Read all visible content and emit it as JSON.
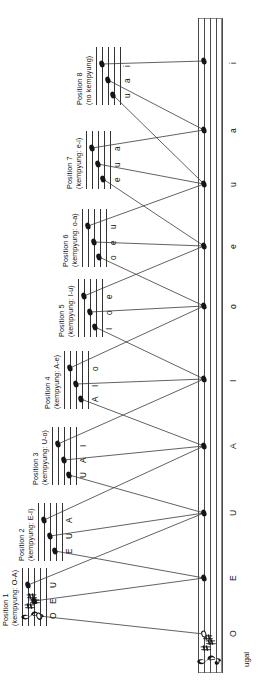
{
  "figure": {
    "title_present": false,
    "orientation": "rotated-90-ccw",
    "main_staff": {
      "name": "ugal",
      "label": "ugal",
      "clef": "treble-clef",
      "key_signature": "three-sharps",
      "notes": [
        {
          "label": "O",
          "head": "open"
        },
        {
          "label": "E",
          "head": "filled"
        },
        {
          "label": "U",
          "head": "filled"
        },
        {
          "label": "A",
          "head": "filled"
        },
        {
          "label": "I",
          "head": "filled"
        },
        {
          "label": "o",
          "head": "filled"
        },
        {
          "label": "e",
          "head": "filled"
        },
        {
          "label": "u",
          "head": "filled"
        },
        {
          "label": "a",
          "head": "filled"
        },
        {
          "label": "i",
          "head": "filled"
        }
      ]
    },
    "positions": [
      {
        "id": 1,
        "title": "Position 1",
        "subtitle": "(kempyung: O-A)",
        "clef": "treble-clef",
        "key_signature": "three-sharps",
        "notes": [
          {
            "label": "O",
            "head": "open"
          },
          {
            "label": "E",
            "head": "filled"
          },
          {
            "label": "U",
            "head": "filled"
          }
        ]
      },
      {
        "id": 2,
        "title": "Position 2",
        "subtitle": "(kempyung: E-I)",
        "clef": "none",
        "key_signature": "none",
        "notes": [
          {
            "label": "E",
            "head": "filled"
          },
          {
            "label": "U",
            "head": "filled"
          },
          {
            "label": "A",
            "head": "filled"
          }
        ]
      },
      {
        "id": 3,
        "title": "Position 3",
        "subtitle": "(kempyung: U-o)",
        "clef": "none",
        "key_signature": "none",
        "notes": [
          {
            "label": "U",
            "head": "filled"
          },
          {
            "label": "A",
            "head": "filled"
          },
          {
            "label": "I",
            "head": "filled"
          }
        ]
      },
      {
        "id": 4,
        "title": "Position 4",
        "subtitle": "(kempyung: A-e)",
        "clef": "none",
        "key_signature": "none",
        "notes": [
          {
            "label": "A",
            "head": "filled"
          },
          {
            "label": "I",
            "head": "filled"
          },
          {
            "label": "o",
            "head": "filled"
          }
        ]
      },
      {
        "id": 5,
        "title": "Position 5",
        "subtitle": "(kempyung: I-u)",
        "clef": "none",
        "key_signature": "none",
        "notes": [
          {
            "label": "I",
            "head": "filled"
          },
          {
            "label": "o",
            "head": "filled"
          },
          {
            "label": "e",
            "head": "filled"
          }
        ]
      },
      {
        "id": 6,
        "title": "Position 6",
        "subtitle": "(kempyung: o-a)",
        "clef": "none",
        "key_signature": "none",
        "notes": [
          {
            "label": "o",
            "head": "filled"
          },
          {
            "label": "e",
            "head": "filled"
          },
          {
            "label": "u",
            "head": "filled"
          }
        ]
      },
      {
        "id": 7,
        "title": "Position 7",
        "subtitle": "(kempyung: e-i)",
        "clef": "none",
        "key_signature": "none",
        "notes": [
          {
            "label": "e",
            "head": "filled"
          },
          {
            "label": "u",
            "head": "filled"
          },
          {
            "label": "a",
            "head": "filled"
          }
        ]
      },
      {
        "id": 8,
        "title": "Position 8",
        "subtitle": "(no kempyung)",
        "clef": "none",
        "key_signature": "none",
        "notes": [
          {
            "label": "u",
            "head": "filled"
          },
          {
            "label": "a",
            "head": "filled"
          },
          {
            "label": "i",
            "head": "filled"
          }
        ]
      }
    ],
    "colors": {
      "ink": "#151515",
      "staff_line": "#333333",
      "connector": "#3a3a3a",
      "background": "#ffffff"
    }
  }
}
